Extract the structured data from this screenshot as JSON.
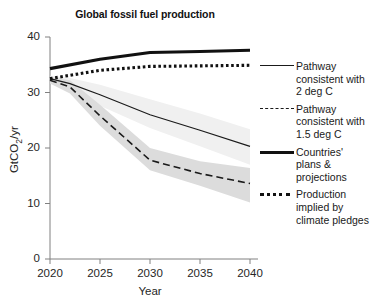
{
  "chart_data": {
    "type": "line",
    "title": "Global fossil fuel production",
    "xlabel": "Year",
    "ylabel": "GtCO2/yr",
    "ylabel_parts": {
      "pre": "GtCO",
      "sub": "2",
      "post": "/yr"
    },
    "x": [
      2020,
      2025,
      2030,
      2035,
      2040
    ],
    "xlim": [
      2020,
      2040
    ],
    "ylim": [
      0,
      40
    ],
    "xticks": [
      "2020",
      "2025",
      "2030",
      "2035",
      "2040"
    ],
    "yticks": [
      "0",
      "10",
      "20",
      "30",
      "40"
    ],
    "grid": false,
    "legend_position": "right",
    "series": [
      {
        "name": "Pathway consistent with 2 deg C",
        "style": "thin-solid",
        "color": "#1a1a1a",
        "x": [
          2020,
          2022,
          2025,
          2030,
          2035,
          2040
        ],
        "values": [
          32.5,
          31.6,
          29.6,
          26.0,
          23.2,
          20.3
        ],
        "band_low": [
          32.0,
          30.2,
          27.6,
          23.6,
          20.3,
          17.0
        ],
        "band_high": [
          33.0,
          32.6,
          31.4,
          28.8,
          26.2,
          23.4
        ],
        "band_color": "#f0f0f0"
      },
      {
        "name": "Pathway consistent with 1.5 deg C",
        "style": "dashed",
        "color": "#1a1a1a",
        "x": [
          2020,
          2022,
          2025,
          2030,
          2035,
          2040
        ],
        "values": [
          32.2,
          31.0,
          25.8,
          17.8,
          15.4,
          13.6
        ],
        "band_low": [
          31.6,
          29.8,
          24.0,
          16.0,
          13.2,
          10.2
        ],
        "band_high": [
          32.8,
          32.2,
          27.8,
          20.0,
          17.6,
          16.4
        ],
        "band_color": "#dcdcdc"
      },
      {
        "name": "Countries' plans & projections",
        "style": "thick-solid",
        "color": "#111111",
        "x": [
          2020,
          2025,
          2030,
          2035,
          2040
        ],
        "values": [
          34.3,
          36.0,
          37.2,
          37.4,
          37.6
        ]
      },
      {
        "name": "Production implied by climate pledges",
        "style": "dotted",
        "color": "#111111",
        "x": [
          2020,
          2025,
          2030,
          2035,
          2040
        ],
        "values": [
          32.5,
          34.0,
          34.7,
          34.8,
          34.9
        ]
      }
    ]
  },
  "title": "Global fossil fuel production",
  "axes": {
    "x_title": "Year",
    "y_title_pre": "GtCO",
    "y_title_sub": "2",
    "y_title_post": "/yr",
    "x_ticks": [
      "2020",
      "2025",
      "2030",
      "2035",
      "2040"
    ],
    "y_ticks": [
      "40",
      "30",
      "20",
      "10",
      "0"
    ]
  },
  "legend": {
    "items": [
      {
        "label": "Pathway\nconsistent with\n2 deg C",
        "style": "thin-solid"
      },
      {
        "label": "Pathway\nconsistent with\n1.5 deg C",
        "style": "dashed"
      },
      {
        "label": "Countries'\nplans &\nprojections",
        "style": "thick-solid"
      },
      {
        "label": "Production\nimplied by\nclimate pledges",
        "style": "dotted"
      }
    ]
  }
}
